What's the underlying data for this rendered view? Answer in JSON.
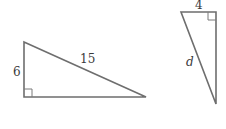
{
  "figure": {
    "type": "geometry-diagram",
    "line_color": "#6e6e6e",
    "triangles": [
      {
        "id": "left-triangle",
        "right_angle": "bottom-left",
        "labels": {
          "vertical_leg": "6",
          "hypotenuse": "15"
        }
      },
      {
        "id": "right-triangle",
        "right_angle": "top-right",
        "labels": {
          "top_leg": "4",
          "hypotenuse": "d"
        }
      }
    ]
  }
}
